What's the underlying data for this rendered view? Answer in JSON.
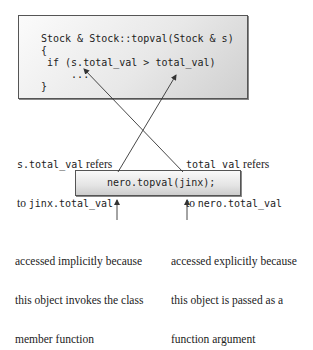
{
  "code_box": {
    "lines": [
      "Stock & Stock::topval(Stock & s)",
      "{",
      " if (s.total_val > total_val)",
      "     ...",
      "}"
    ]
  },
  "left_note": {
    "line1_code": "s.total_val",
    "line1_text": " refers",
    "line2_text": "to ",
    "line2_code": "jinx.total_val"
  },
  "right_note": {
    "line1_code": "total_val",
    "line1_text": " refers",
    "line2_text": "to ",
    "line2_code": "nero.total_val"
  },
  "call_box": {
    "code": "nero.topval(jinx);"
  },
  "left_caption": {
    "lines": [
      "accessed implicitly because",
      "this object invokes the class",
      "member function"
    ]
  },
  "right_caption": {
    "lines": [
      "accessed explicitly because",
      "this object is passed as a",
      "function argument"
    ]
  },
  "colors": {
    "line": "#333333",
    "border": "#555555",
    "text": "#222222"
  }
}
